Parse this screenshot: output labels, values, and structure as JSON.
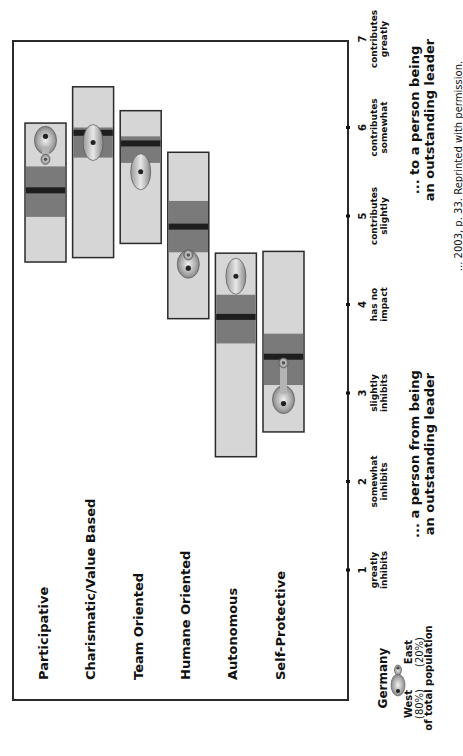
{
  "chart_data": {
    "type": "range-bar",
    "title": "",
    "orientation_note": "figure rotated 90 degrees counter-clockwise",
    "axis": {
      "min": 1,
      "max": 7,
      "ticks": [
        {
          "value": 1,
          "number": "1",
          "line1": "greatly",
          "line2": "inhibits"
        },
        {
          "value": 2,
          "number": "2",
          "line1": "somewhat",
          "line2": "inhibits"
        },
        {
          "value": 3,
          "number": "3",
          "line1": "slightly",
          "line2": "inhibits"
        },
        {
          "value": 4,
          "number": "4",
          "line1": "has no",
          "line2": "impact"
        },
        {
          "value": 5,
          "number": "5",
          "line1": "contributes",
          "line2": "slightly"
        },
        {
          "value": 6,
          "number": "6",
          "line1": "contributes",
          "line2": "somewhat"
        },
        {
          "value": 7,
          "number": "7",
          "line1": "contributes",
          "line2": "greatly"
        }
      ],
      "low_caption": [
        "... a person from being",
        "an outstanding leader"
      ],
      "high_caption": [
        "... to a person being",
        "an outstanding leader"
      ]
    },
    "categories": [
      "Participative",
      "Charismatic/Value Based",
      "Team Oriented",
      "Humane Oriented",
      "Autonomous",
      "Self-Protective"
    ],
    "series": [
      {
        "name": "Range (min-max across cultures)",
        "values": [
          [
            4.48,
            6.05
          ],
          [
            4.53,
            6.46
          ],
          [
            4.69,
            6.19
          ],
          [
            3.84,
            5.72
          ],
          [
            2.28,
            4.58
          ],
          [
            2.56,
            4.6
          ]
        ]
      },
      {
        "name": "Mid band",
        "values": [
          [
            4.99,
            5.56
          ],
          [
            5.66,
            6.0
          ],
          [
            5.6,
            5.9
          ],
          [
            4.59,
            5.17
          ],
          [
            3.56,
            4.11
          ],
          [
            3.09,
            3.67
          ]
        ]
      },
      {
        "name": "Mean",
        "values": [
          5.29,
          5.94,
          5.82,
          4.88,
          3.86,
          3.41
        ]
      },
      {
        "name": "Germany West",
        "values": [
          5.9,
          5.83,
          5.5,
          4.41,
          4.32,
          2.88
        ]
      },
      {
        "name": "Germany East",
        "values": [
          5.64,
          5.83,
          5.5,
          4.56,
          4.32,
          3.34
        ]
      }
    ],
    "legend": {
      "title": "Germany",
      "west_label": "West",
      "west_share": "(80%)",
      "east_label": "East",
      "east_share": "(20%)",
      "caption": "of total population",
      "placement": "bottom-left"
    },
    "source_note": "... 2003, p. 33. Reprinted with permission."
  },
  "colors": {
    "range_fill": "#d6d6d6",
    "band_fill": "#7a7a7a",
    "mean_line": "#1e1e1e",
    "border": "#2a2a2a",
    "blob_light": "#d9d9d9",
    "blob_dark": "#8a8a8a"
  }
}
